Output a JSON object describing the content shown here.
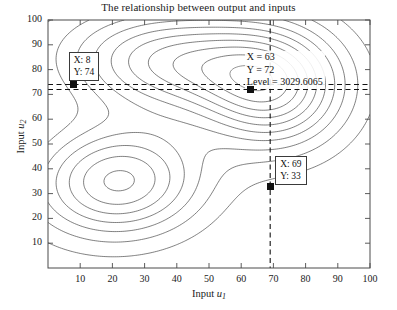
{
  "figure": {
    "title": "The relationship between output and inputs",
    "background_color": "#ffffff",
    "axis_color": "#4a4a4a",
    "contour_color": "#2b2b2b",
    "marker_color": "#111111"
  },
  "axes": {
    "x": {
      "label_prefix": "Input ",
      "label_var": "u",
      "label_sub": "1",
      "ticks": [
        10,
        20,
        30,
        40,
        50,
        60,
        70,
        80,
        90,
        100
      ],
      "min": 0,
      "max": 100
    },
    "y": {
      "label_prefix": "Input ",
      "label_var": "u",
      "label_sub": "2",
      "ticks": [
        10,
        20,
        30,
        40,
        50,
        60,
        70,
        80,
        90,
        100
      ],
      "min": 0,
      "max": 100
    }
  },
  "annotations": {
    "left_box": {
      "x_label": "X: 8",
      "y_label": "Y: 74",
      "point_x": 8,
      "point_y": 74
    },
    "center_label": {
      "x_label": "X = 63",
      "y_label": "Y = 72",
      "level_label": "Level = 3029.6065",
      "point_x": 63,
      "point_y": 72,
      "level": 3029.6065
    },
    "bottom_box": {
      "x_label": "X: 69",
      "y_label": "Y: 33",
      "point_x": 69,
      "point_y": 33
    }
  },
  "chart_data": {
    "type": "contour",
    "title": "The relationship between output and inputs",
    "xlabel": "Input u1",
    "ylabel": "Input u2",
    "xlim": [
      0,
      100
    ],
    "ylim": [
      0,
      100
    ],
    "grid": false,
    "legend": "none",
    "n_levels": 14,
    "level_marked": 3029.6065,
    "peaks": [
      {
        "name": "upper-left-peak",
        "cx": 40,
        "cy": 83,
        "rx": 26,
        "ry": 16,
        "rotation_deg": -4
      },
      {
        "name": "lower-left-peak",
        "cx": 22,
        "cy": 35,
        "rx": 20,
        "ry": 17,
        "rotation_deg": 8
      },
      {
        "name": "right-peak",
        "cx": 70,
        "cy": 72,
        "rx": 17,
        "ry": 19,
        "rotation_deg": 0
      }
    ],
    "markers": [
      {
        "name": "left-marker",
        "x": 8,
        "y": 74
      },
      {
        "name": "center-marker",
        "x": 63,
        "y": 72
      },
      {
        "name": "bottom-marker",
        "x": 69,
        "y": 33
      }
    ],
    "crosshairs": [
      {
        "orientation": "horizontal",
        "value": 74
      },
      {
        "orientation": "horizontal",
        "value": 72
      },
      {
        "orientation": "vertical",
        "value": 69
      }
    ]
  }
}
